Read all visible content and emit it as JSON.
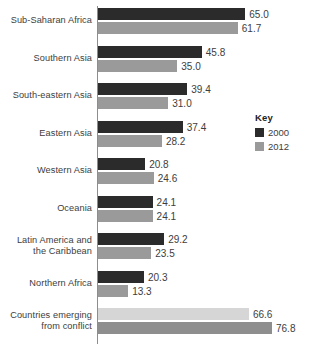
{
  "chart_data": {
    "type": "bar",
    "orientation": "horizontal",
    "title": "",
    "xlabel": "",
    "ylabel": "",
    "grid": false,
    "xlim": [
      0,
      76.8
    ],
    "legend_position": "right",
    "categories": [
      "Sub-Saharan Africa",
      "Southern Asia",
      "South-eastern Asia",
      "Eastern Asia",
      "Western Asia",
      "Oceania",
      "Latin America and the Caribbean",
      "Northern Africa",
      "Countries emerging from conflict"
    ],
    "series": [
      {
        "name": "2000",
        "values": [
          65.0,
          45.8,
          39.4,
          37.4,
          20.8,
          24.1,
          29.2,
          20.3,
          66.6
        ]
      },
      {
        "name": "2012",
        "values": [
          61.7,
          35.0,
          31.0,
          28.2,
          24.6,
          24.1,
          23.5,
          13.3,
          76.8
        ]
      }
    ],
    "value_labels": {
      "2000": [
        "65.0",
        "45.8",
        "39.4",
        "37.4",
        "20.8",
        "24.1",
        "29.2",
        "20.3",
        "66.6"
      ],
      "2012": [
        "61.7",
        "35.0",
        "31.0",
        "28.2",
        "24.6",
        "24.1",
        "23.5",
        "13.3",
        "76.8"
      ]
    },
    "category_label_lines": [
      [
        "Sub-Saharan Africa"
      ],
      [
        "Southern Asia"
      ],
      [
        "South-eastern Asia"
      ],
      [
        "Eastern Asia"
      ],
      [
        "Western Asia"
      ],
      [
        "Oceania"
      ],
      [
        "Latin America and",
        "the Caribbean"
      ],
      [
        "Northern Africa"
      ],
      [
        "Countries emerging",
        "from conflict"
      ]
    ],
    "highlight_row_index": 8
  },
  "legend": {
    "title": "Key",
    "items": [
      {
        "label": "2000",
        "color": "#2b2b2b"
      },
      {
        "label": "2012",
        "color": "#9a9a9a"
      }
    ]
  },
  "colors": {
    "series_2000": "#2b2b2b",
    "series_2012": "#9a9a9a",
    "series_2000_light": "#d6d6d6",
    "series_2012_light": "#8e8e8e",
    "axis": "#8d8d8d",
    "text": "#3d3d3d",
    "background": "#ffffff"
  }
}
